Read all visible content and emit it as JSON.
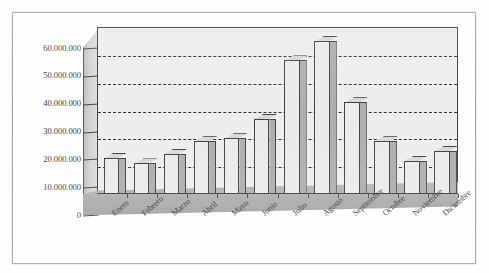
{
  "chart_data": {
    "type": "bar",
    "title": "",
    "subtitle": "",
    "xlabel": "",
    "ylabel": "",
    "categories": [
      "Enero",
      "Febrero",
      "Marzo",
      "Abril",
      "Mayo",
      "Junio",
      "Julio",
      "Agosto",
      "Septiembre",
      "Octubre",
      "Noviembre",
      "Diciembre"
    ],
    "values": [
      13000000,
      11000000,
      14500000,
      19000000,
      20000000,
      27000000,
      48000000,
      55000000,
      33000000,
      19000000,
      12000000,
      15500000
    ],
    "ylim": [
      0,
      60000000
    ],
    "ytick_values": [
      60000000,
      50000000,
      40000000,
      30000000,
      20000000,
      10000000,
      0
    ],
    "ytick_labels": [
      "60.000.000",
      "50.000.000",
      "40.000.000",
      "30.000.000",
      "20.000.000",
      "10.000.000",
      "0"
    ],
    "grid": true,
    "gridlines_at": [
      10000000,
      20000000,
      30000000,
      40000000,
      50000000
    ],
    "legend": [],
    "legend_position": "none",
    "annotations": [],
    "style": "3d-column",
    "colors": {
      "bar_front": "#e9e9e8",
      "bar_side": "#a5a5a5",
      "bar_top": "#d3d3d2",
      "plot_background": "#ececeb",
      "floor": "#a8a8a8",
      "axis": "#2b2b2b",
      "gridline": "#1d1d1d",
      "frame": "#9a9a9a",
      "text": "#262626"
    }
  }
}
